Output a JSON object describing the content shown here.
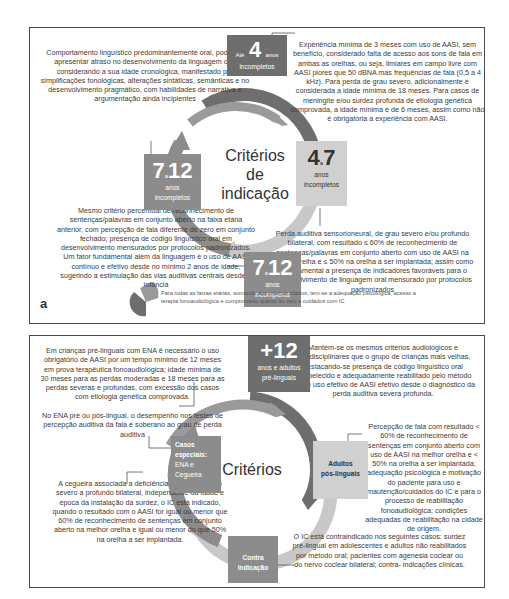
{
  "panel_a": {
    "letter": "a",
    "center_title": [
      "Critérios",
      "de",
      "indicação"
    ],
    "boxes": {
      "top": {
        "prefix": "Até",
        "number": "4",
        "suffix": "anos",
        "sub": "incompletos"
      },
      "right": {
        "number_a": "4",
        "sep": "a",
        "number_b": "7",
        "line1": "anos",
        "line2": "incompletos"
      },
      "left": {
        "number_a": "7",
        "sep": "a",
        "number_b": "12",
        "line1": "anos",
        "line2": "incompletos"
      },
      "bottom": {
        "number_a": "7",
        "sep": "a",
        "number_b": "12",
        "line1": "anos",
        "line2": "incompletos"
      }
    },
    "texts": {
      "top_left": "Comportamento linguístico predominantemente oral, podendo apresentar atraso no desenvolvimento da linguagem oral considerando a sua idade cronológica, manifestado por simplificações fonológicas, alterações sintáticas, semânticas e no desenvolvimento pragmático, com habilidades de narrativa e argumentação ainda incipientes",
      "top_right": "Experiência mínima de 3 meses com uso de AASI, sem benefício, considerado falta de acesso aos sons de fala em ambas as orelhas, ou seja, limiares em campo livre com AASI piores que 50 dBNA mas frequências de fala (0,5 a 4 kHz). Para perda de grau severo, adicionalmente é considerada a idade mínima de 18 meses. Para casos de meningite e/ou surdez profunda de etiologia genética comprovada, a idade mínima é de 6 meses, assim como não é obrigatória a experiência com AASI.",
      "bottom_left": "Mesmo critério percentual de reconhecimento de sentenças/palavras em conjunto aberto na faixa etária anterior, com percepção de fala diferente de zero em conjunto fechado; presença de código linguístico oral em desenvolvimento mensurados por protocolos padronizados. Um fator fundamental além da linguagem é o uso de AASI contínuo e efetivo desde no mínimo 2 anos de idade, sugerindo a estimulação das vias auditivas centrais desde a infância",
      "bottom_right": "Perda auditiva sensorioneural, de grau severo e/ou profundo bilateral, com resultado ≤ 60% de reconhecimento de sentenças/palavras em conjunto aberto com uso de AASI na melhor orelha e ≤ 50% na orelha a ser implantada; assim como é fundamental a presença de indicadores favoráveis para o desenvolvimento de linguagem oral mensurado por protocolos padronizados"
    },
    "footnote": "Para todas as faixas etárias, somando aos critérios citados, tem-se a adequação psicológica, acesso a terapia fonoaudiológica e compromisso quanto ao zelo e cuidados com IC"
  },
  "panel_b": {
    "center_title": "Critérios",
    "boxes": {
      "top": {
        "number": "+12",
        "line1": "anos e adultos",
        "line2": "pré-linguais"
      },
      "left": {
        "line1": "Casos",
        "line2": "especiais:",
        "line3": "ENA e",
        "line4": "Cegueira"
      },
      "right": {
        "line1": "Adultos",
        "line2": "pós-linguais"
      },
      "bottom": {
        "line1": "Contra",
        "line2": "indicação"
      }
    },
    "texts": {
      "top_left": "Em crianças pré-linguais com ENA é necessário o uso obrigatório de AASI por um tempo mínimo de 12 meses em prova terapêutica fonoaudiológica; idade mínima de 30 meses para as perdas moderadas e 18 meses para as perdas severas e profundas, com excessão dos casos com etiologia genética comprovada.",
      "top_left_2": "No ENA pré ou pós-lingual, o desempenho nos testes de percepção auditiva da fala é soberano ao grau de perda auditiva",
      "top_right": "Mantém-se os mesmos critérios audiológicos e interdisciplinares que o grupo de crianças mais velhas, destacando-se presença de código linguístico oral estabelecido e adequadamente reabilitado pelo método oral, e uso efetivo de AASI efetivo desde o diagnóstico da perda auditiva severa profunda.",
      "right": "Percepção de fala com resultado < 60% de reconhecimento de sentenças em conjunto aberto com uso de AASI na melhor orelha e < 50% na orelha a ser implantada; adequação psicológica e motivação do paciente para uso e mautenção/cuidados do IC e para o processo de reabilitação fonoaudiológica; condições adequadas de reabilitação na cidade de origem.",
      "bottom_left": "A cegueira associada a deficiência auditiva de grau severo a profundo bilateral, independente da idade e época da instalação da surdez, o IC está indicado, quando o resultado com o AASI for igual ou menor que 60% de reconhecimento de sentenças em conjunto aberto na melhor orelha e igual ou menor do que 50% na orelha a ser implantada.",
      "bottom_right": "O IC está contraindicado nos seguintes casos: surdez pré-lingual em adolescentes e adultos não reabilitados por método oral; pacientes com agenesia coclear ou do nervo coclear bilateral; contra- indicações clínicas."
    }
  },
  "colors": {
    "dark_gray": "#6e6e6e",
    "mid_gray": "#8c8c8c",
    "light_gray": "#d0d0d0",
    "arrow_light": "#c4c4c4",
    "border": "#4a4a4a"
  }
}
